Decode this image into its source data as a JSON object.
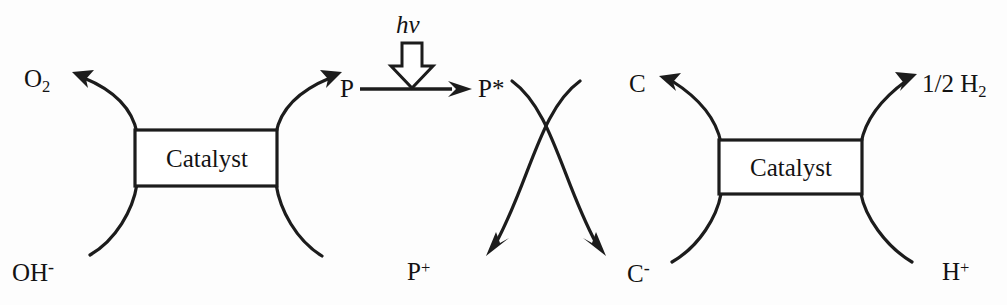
{
  "diagram": {
    "background_color": "#fdfdfd",
    "ink_color": "#1c1c1c",
    "catalyst_left": {
      "label": "Catalyst"
    },
    "catalyst_right": {
      "label": "Catalyst"
    },
    "photon": {
      "label_text": "hv",
      "h_text": "h",
      "nu_text": "v",
      "arrow_style": "hollow-block-down"
    },
    "species": {
      "oxygen": {
        "text": "O",
        "subscript": "2"
      },
      "hydroxide": {
        "text": "OH",
        "charge": "-"
      },
      "photosensitizer": {
        "text": "P"
      },
      "photosensitizer_excited": {
        "text": "P*"
      },
      "photosensitizer_oxidized": {
        "text": "P",
        "charge": "+"
      },
      "relay": {
        "text": "C"
      },
      "relay_reduced": {
        "text": "C",
        "charge": "-"
      },
      "hydrogen": {
        "prefix": "1/2 ",
        "text": "H",
        "subscript": "2"
      },
      "proton": {
        "text": "H",
        "charge": "+"
      }
    },
    "transitions": {
      "excitation": "P to P*",
      "oxidation": "P* to P+",
      "reduction": "C to C-"
    }
  }
}
